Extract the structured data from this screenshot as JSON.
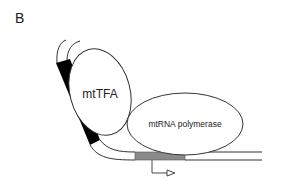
{
  "figure": {
    "panel_label": "B",
    "proteins": [
      {
        "name": "mtTFA"
      },
      {
        "name": "mtRNA polymerase"
      }
    ],
    "colors": {
      "line": "#333333",
      "binding_site": "#000000",
      "promoter_box": "#8a8a8a",
      "background": "#ffffff"
    }
  }
}
